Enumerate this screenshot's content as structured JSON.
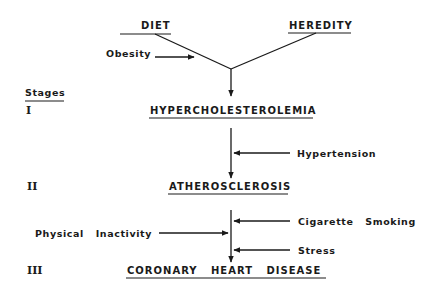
{
  "diagram": {
    "sources": {
      "diet": "DIET",
      "heredity": "HEREDITY"
    },
    "modifiers": {
      "obesity": "Obesity",
      "hypertension": "Hypertension",
      "cigarette_smoking": "Cigarette   Smoking",
      "physical_inactivity": "Physical   Inactivity",
      "stress": "Stress"
    },
    "stages_heading": "Stages",
    "stages": [
      {
        "numeral": "I",
        "label": "HYPERCHOLESTEROLEMIA"
      },
      {
        "numeral": "II",
        "label": "ATHEROSCLEROSIS"
      },
      {
        "numeral": "III",
        "label": "CORONARY   HEART   DISEASE"
      }
    ],
    "colors": {
      "ink": "#1a1a1a",
      "background": "#ffffff"
    }
  }
}
